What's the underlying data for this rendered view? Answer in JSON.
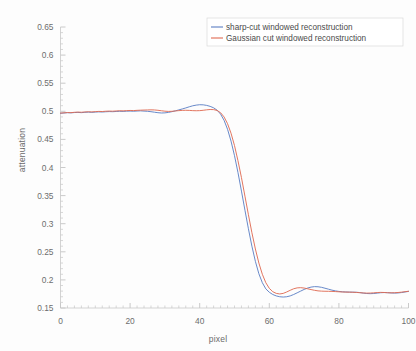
{
  "chart_data": {
    "type": "line",
    "title": "",
    "xlabel": "pixel",
    "ylabel": "attenuation",
    "xlim": [
      0,
      100
    ],
    "ylim": [
      0.15,
      0.65
    ],
    "xticks": [
      0,
      20,
      40,
      60,
      80,
      100
    ],
    "xtick_labels": [
      "0",
      "20",
      "40",
      "60",
      "80",
      "100"
    ],
    "yticks": [
      0.15,
      0.2,
      0.25,
      0.3,
      0.35,
      0.4,
      0.45,
      0.5,
      0.55,
      0.6,
      0.65
    ],
    "ytick_labels": [
      "0.15",
      "0.2",
      "0.25",
      "0.3",
      "0.35",
      "0.4",
      "0.45",
      "0.5",
      "0.55",
      "0.6",
      "0.65"
    ],
    "grid": false,
    "legend_position": "top-right",
    "series": [
      {
        "name": "sharp-cut windowed reconstruction",
        "color": "#5b7fc4",
        "x": [
          0,
          1,
          2,
          3,
          4,
          5,
          6,
          7,
          8,
          9,
          10,
          11,
          12,
          13,
          14,
          15,
          16,
          17,
          18,
          19,
          20,
          21,
          22,
          23,
          24,
          25,
          26,
          27,
          28,
          29,
          30,
          31,
          32,
          33,
          34,
          35,
          36,
          37,
          38,
          39,
          40,
          41,
          42,
          43,
          44,
          45,
          46,
          47,
          48,
          49,
          50,
          51,
          52,
          53,
          54,
          55,
          56,
          57,
          58,
          59,
          60,
          61,
          62,
          63,
          64,
          65,
          66,
          67,
          68,
          69,
          70,
          71,
          72,
          73,
          74,
          75,
          76,
          77,
          78,
          79,
          80,
          81,
          82,
          83,
          84,
          85,
          86,
          87,
          88,
          89,
          90,
          91,
          92,
          93,
          94,
          95,
          96,
          97,
          98,
          99,
          100
        ],
        "y": [
          0.4965,
          0.497,
          0.4975,
          0.4972,
          0.4978,
          0.498,
          0.4976,
          0.4982,
          0.4985,
          0.4981,
          0.4986,
          0.499,
          0.4987,
          0.4992,
          0.4995,
          0.4993,
          0.4997,
          0.5,
          0.4998,
          0.5002,
          0.5004,
          0.5001,
          0.5005,
          0.5008,
          0.5004,
          0.5,
          0.4993,
          0.4984,
          0.4975,
          0.497,
          0.4972,
          0.498,
          0.4993,
          0.5008,
          0.5025,
          0.5042,
          0.506,
          0.508,
          0.5098,
          0.511,
          0.5117,
          0.5115,
          0.5105,
          0.5088,
          0.5062,
          0.502,
          0.495,
          0.484,
          0.468,
          0.447,
          0.421,
          0.391,
          0.358,
          0.324,
          0.291,
          0.26,
          0.233,
          0.211,
          0.195,
          0.184,
          0.178,
          0.174,
          0.1715,
          0.17,
          0.1695,
          0.17,
          0.1715,
          0.174,
          0.177,
          0.18,
          0.183,
          0.1855,
          0.1872,
          0.188,
          0.1878,
          0.1868,
          0.1852,
          0.1835,
          0.1818,
          0.1805,
          0.1795,
          0.1788,
          0.1785,
          0.1783,
          0.1782,
          0.178,
          0.1775,
          0.1765,
          0.1758,
          0.1755,
          0.1758,
          0.1765,
          0.1772,
          0.1775,
          0.1772,
          0.1768,
          0.1765,
          0.1768,
          0.1775,
          0.1785,
          0.1795
        ]
      },
      {
        "name": "Gaussian cut windowed reconstruction",
        "color": "#e06a52",
        "x": [
          0,
          1,
          2,
          3,
          4,
          5,
          6,
          7,
          8,
          9,
          10,
          11,
          12,
          13,
          14,
          15,
          16,
          17,
          18,
          19,
          20,
          21,
          22,
          23,
          24,
          25,
          26,
          27,
          28,
          29,
          30,
          31,
          32,
          33,
          34,
          35,
          36,
          37,
          38,
          39,
          40,
          41,
          42,
          43,
          44,
          45,
          46,
          47,
          48,
          49,
          50,
          51,
          52,
          53,
          54,
          55,
          56,
          57,
          58,
          59,
          60,
          61,
          62,
          63,
          64,
          65,
          66,
          67,
          68,
          69,
          70,
          71,
          72,
          73,
          74,
          75,
          76,
          77,
          78,
          79,
          80,
          81,
          82,
          83,
          84,
          85,
          86,
          87,
          88,
          89,
          90,
          91,
          92,
          93,
          94,
          95,
          96,
          97,
          98,
          99,
          100
        ],
        "y": [
          0.4968,
          0.4973,
          0.4978,
          0.4976,
          0.4982,
          0.4986,
          0.4983,
          0.4988,
          0.4992,
          0.4989,
          0.4994,
          0.4998,
          0.4996,
          0.5001,
          0.5004,
          0.5002,
          0.5006,
          0.501,
          0.5008,
          0.5012,
          0.5015,
          0.5013,
          0.5017,
          0.502,
          0.5022,
          0.5024,
          0.5026,
          0.5024,
          0.5018,
          0.501,
          0.5002,
          0.4998,
          0.5,
          0.5006,
          0.5012,
          0.5016,
          0.5018,
          0.5016,
          0.5012,
          0.501,
          0.5012,
          0.5018,
          0.5026,
          0.5032,
          0.503,
          0.5015,
          0.4975,
          0.49,
          0.478,
          0.461,
          0.439,
          0.412,
          0.382,
          0.349,
          0.316,
          0.284,
          0.255,
          0.23,
          0.21,
          0.195,
          0.185,
          0.179,
          0.176,
          0.175,
          0.176,
          0.1785,
          0.1815,
          0.1842,
          0.1858,
          0.1862,
          0.1855,
          0.1842,
          0.1828,
          0.1815,
          0.1805,
          0.18,
          0.1798,
          0.1797,
          0.1795,
          0.1792,
          0.1788,
          0.1785,
          0.1783,
          0.1782,
          0.178,
          0.1777,
          0.1772,
          0.1768,
          0.1765,
          0.1766,
          0.177,
          0.1775,
          0.1778,
          0.1776,
          0.1772,
          0.177,
          0.1772,
          0.1776,
          0.1782,
          0.179,
          0.1798
        ]
      }
    ]
  },
  "axes": {
    "xlabel": "pixel",
    "ylabel": "attenuation"
  },
  "legend": {
    "entries": [
      {
        "label": "sharp-cut windowed reconstruction",
        "color": "#5b7fc4"
      },
      {
        "label": "Gaussian cut windowed reconstruction",
        "color": "#e06a52"
      }
    ]
  }
}
